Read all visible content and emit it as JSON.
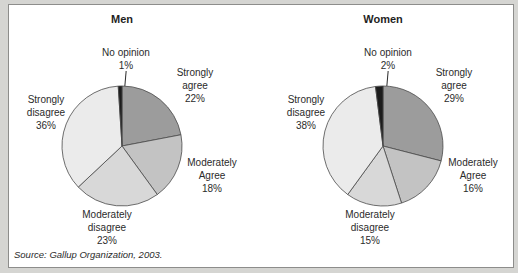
{
  "source_note": "Source: Gallup Organization, 2003.",
  "colors": {
    "background": "#d5d5d2",
    "panel": "#ffffff",
    "panel_border": "#8d8d8b",
    "slice_stroke": "#4a4a4a",
    "strongly_agree": "#9c9c9c",
    "moderately_agree": "#c3c3c3",
    "moderately_disagree": "#d8d8d8",
    "strongly_disagree": "#ebebeb",
    "no_opinion": "#1c1c1c"
  },
  "charts": [
    {
      "title": "Men",
      "labels": {
        "no_opinion": "No opinion\n1%",
        "strongly_agree": "Strongly\nagree\n22%",
        "moderately_agree": "Moderately\nAgree\n18%",
        "moderately_disagree": "Moderately\ndisagree\n23%",
        "strongly_disagree": "Strongly\ndisagree\n36%"
      }
    },
    {
      "title": "Women",
      "labels": {
        "no_opinion": "No opinion\n2%",
        "strongly_agree": "Strongly\nagree\n29%",
        "moderately_agree": "Moderately\nAgree\n16%",
        "moderately_disagree": "Moderately\ndisagree\n15%",
        "strongly_disagree": "Strongly\ndisagree\n38%"
      }
    }
  ],
  "chart_data": [
    {
      "type": "pie",
      "title": "Men",
      "start_angle_deg": 0,
      "direction": "clockwise",
      "stroke": "#4a4a4a",
      "slices": [
        {
          "label": "Strongly agree",
          "value": 22,
          "color": "#9c9c9c"
        },
        {
          "label": "Moderately Agree",
          "value": 18,
          "color": "#c3c3c3"
        },
        {
          "label": "Moderately disagree",
          "value": 23,
          "color": "#d8d8d8"
        },
        {
          "label": "Strongly disagree",
          "value": 36,
          "color": "#ebebeb"
        },
        {
          "label": "No opinion",
          "value": 1,
          "color": "#1c1c1c"
        }
      ]
    },
    {
      "type": "pie",
      "title": "Women",
      "start_angle_deg": 0,
      "direction": "clockwise",
      "stroke": "#4a4a4a",
      "slices": [
        {
          "label": "Strongly agree",
          "value": 29,
          "color": "#9c9c9c"
        },
        {
          "label": "Moderately Agree",
          "value": 16,
          "color": "#c3c3c3"
        },
        {
          "label": "Moderately disagree",
          "value": 15,
          "color": "#d8d8d8"
        },
        {
          "label": "Strongly disagree",
          "value": 38,
          "color": "#ebebeb"
        },
        {
          "label": "No opinion",
          "value": 2,
          "color": "#1c1c1c"
        }
      ]
    }
  ]
}
